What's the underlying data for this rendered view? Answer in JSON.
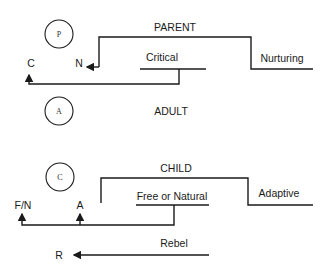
{
  "diagram": {
    "states": [
      {
        "id": "P",
        "circle_label": "P",
        "name": "PARENT"
      },
      {
        "id": "A",
        "circle_label": "A",
        "name": "ADULT"
      },
      {
        "id": "C",
        "circle_label": "C",
        "name": "CHILD"
      }
    ],
    "parent": {
      "title": "PARENT",
      "left_branch": "Critical",
      "right_branch": "Nurturing",
      "markers": {
        "left": "C",
        "right": "N"
      }
    },
    "adult": {
      "title": "ADULT"
    },
    "child": {
      "title": "CHILD",
      "left_branch": "Free or Natural",
      "right_branch": "Adaptive",
      "markers": {
        "left": "F/N",
        "right": "A"
      },
      "rebel": {
        "label": "Rebel",
        "marker": "R"
      }
    },
    "colors": {
      "line": "#1a1a1a",
      "background": "#ffffff"
    }
  }
}
